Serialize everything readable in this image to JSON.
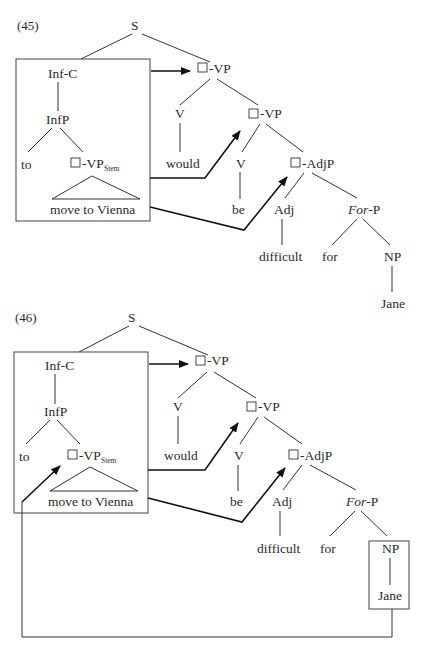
{
  "examples": [
    {
      "number": "(45)",
      "nodes": {
        "S": "S",
        "InfC": "Inf-C",
        "InfP": "InfP",
        "to": "to",
        "VPStem": "-VP",
        "VPStem_sub": "Stem",
        "moveToVienna": "move to Vienna",
        "VP1": "-VP",
        "V1": "V",
        "would": "would",
        "VP2": "-VP",
        "V2": "V",
        "be": "be",
        "AdjP": "-AdjP",
        "Adj": "Adj",
        "difficult": "difficult",
        "ForP_italic": "For",
        "ForP_rest": "-P",
        "for": "for",
        "NP": "NP",
        "Jane": "Jane"
      }
    },
    {
      "number": "(46)",
      "nodes": {
        "S": "S",
        "InfC": "Inf-C",
        "InfP": "InfP",
        "to": "to",
        "VPStem": "-VP",
        "VPStem_sub": "Stem",
        "moveToVienna": "move to Vienna",
        "VP1": "-VP",
        "V1": "V",
        "would": "would",
        "VP2": "-VP",
        "V2": "V",
        "be": "be",
        "AdjP": "-AdjP",
        "Adj": "Adj",
        "difficult": "difficult",
        "ForP_italic": "For",
        "ForP_rest": "-P",
        "for": "for",
        "NP": "NP",
        "Jane": "Jane"
      }
    }
  ]
}
